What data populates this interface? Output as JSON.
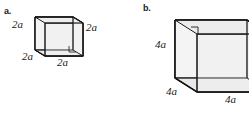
{
  "figure": {
    "background_color": "#ffffff",
    "line_color": "#1a1a1a",
    "face_fill_light": "#f2f2f2",
    "face_fill_mid": "#e3e3e3",
    "face_fill_top": "#ededed"
  },
  "parts": [
    {
      "key": "a",
      "label": "a.",
      "shape": "cube",
      "edge_length_label": "2a",
      "edge_coefficient": "2",
      "edge_variable": "a",
      "dimension_labels": [
        {
          "name": "left-edge",
          "text": "2a",
          "coefficient": "2",
          "variable": "a"
        },
        {
          "name": "right-edge",
          "text": "2a",
          "coefficient": "2",
          "variable": "a"
        },
        {
          "name": "front-bottom-left-edge",
          "text": "2a",
          "coefficient": "2",
          "variable": "a"
        },
        {
          "name": "front-bottom-right-edge",
          "text": "2a",
          "coefficient": "2",
          "variable": "a"
        }
      ]
    },
    {
      "key": "b",
      "label": "b.",
      "shape": "cube",
      "edge_length_label": "4a",
      "edge_coefficient": "4",
      "edge_variable": "a",
      "dimension_labels": [
        {
          "name": "left-edge",
          "text": "4a",
          "coefficient": "4",
          "variable": "a"
        },
        {
          "name": "front-bottom-left-edge",
          "text": "4a",
          "coefficient": "4",
          "variable": "a"
        },
        {
          "name": "front-bottom-right-edge",
          "text": "4a",
          "coefficient": "4",
          "variable": "a"
        }
      ]
    }
  ]
}
